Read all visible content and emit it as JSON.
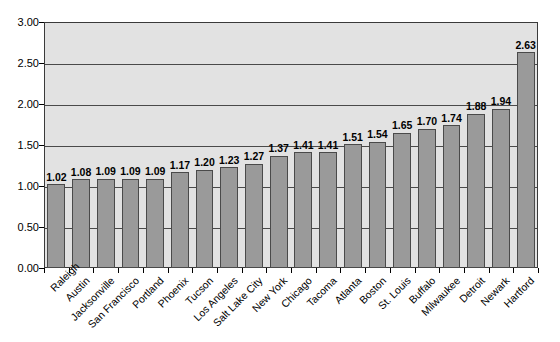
{
  "chart_data": {
    "type": "bar",
    "title": "",
    "subtitle": "",
    "xlabel": "",
    "ylabel": "",
    "ylim": [
      0,
      3.0
    ],
    "ytick_interval": 0.5,
    "yticks": [
      "0.00",
      "0.50",
      "1.00",
      "1.50",
      "2.00",
      "2.50",
      "3.00"
    ],
    "ytick_values": [
      0,
      0.5,
      1.0,
      1.5,
      2.0,
      2.5,
      3.0
    ],
    "grid": "horizontal",
    "legend": "none",
    "bar_color": "#9a9a9a",
    "bar_border_color": "#4a4a4a",
    "plot_background": "#e2e2e2",
    "axis_color": "#3a3a3a",
    "label_rotation": -45,
    "show_data_labels": true,
    "categories": [
      "Raleigh",
      "Austin",
      "Jacksonville",
      "San Francisco",
      "Portland",
      "Phoenix",
      "Tucson",
      "Los Angeles",
      "Salt Lake City",
      "New York",
      "Chicago",
      "Tacoma",
      "Atlanta",
      "Boston",
      "St. Louis",
      "Buffalo",
      "Milwaukee",
      "Detroit",
      "Newark",
      "Hartford"
    ],
    "values": [
      1.02,
      1.08,
      1.09,
      1.09,
      1.09,
      1.17,
      1.2,
      1.23,
      1.27,
      1.37,
      1.41,
      1.41,
      1.51,
      1.54,
      1.65,
      1.7,
      1.74,
      1.88,
      1.94,
      2.63
    ],
    "value_labels": [
      "1.02",
      "1.08",
      "1.09",
      "1.09",
      "1.09",
      "1.17",
      "1.20",
      "1.23",
      "1.27",
      "1.37",
      "1.41",
      "1.41",
      "1.51",
      "1.54",
      "1.65",
      "1.70",
      "1.74",
      "1.88",
      "1.94",
      "2.63"
    ]
  }
}
